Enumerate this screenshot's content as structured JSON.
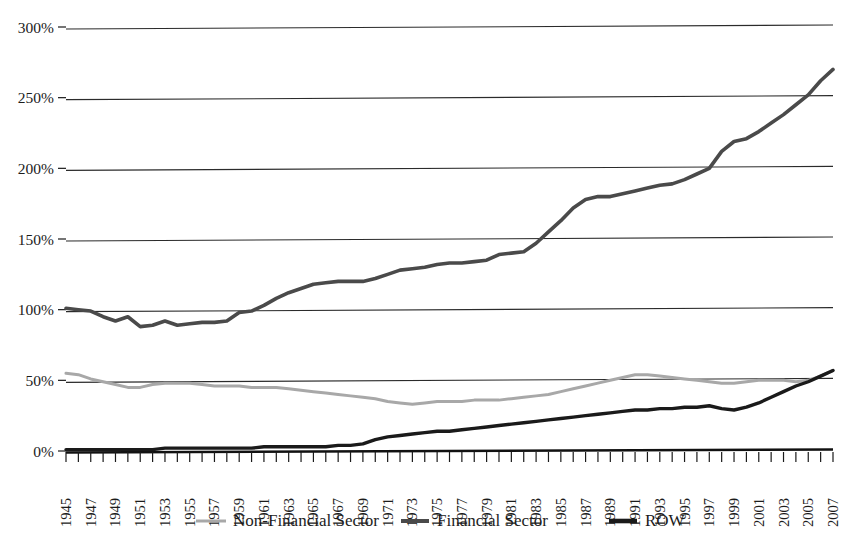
{
  "chart_data": {
    "type": "line",
    "title": "",
    "subtitle": "",
    "xlabel": "",
    "ylabel": "",
    "ylim": [
      0,
      300
    ],
    "xlim": [
      1945,
      2007
    ],
    "grid": true,
    "legend_position": "bottom",
    "ytick_labels": [
      "0%",
      "50%",
      "100%",
      "150%",
      "200%",
      "250%",
      "300%"
    ],
    "ytick_values": [
      0,
      50,
      100,
      150,
      200,
      250,
      300
    ],
    "xtick_labels": [
      "1945",
      "1947",
      "1949",
      "1951",
      "1953",
      "1955",
      "1957",
      "1959",
      "1961",
      "1963",
      "1965",
      "1967",
      "1969",
      "1971",
      "1973",
      "1975",
      "1977",
      "1979",
      "1981",
      "1983",
      "1985",
      "1987",
      "1989",
      "1991",
      "1993",
      "1995",
      "1997",
      "1999",
      "2001",
      "2003",
      "2005",
      "2007"
    ],
    "xtick_values": [
      1945,
      1947,
      1949,
      1951,
      1953,
      1955,
      1957,
      1959,
      1961,
      1963,
      1965,
      1967,
      1969,
      1971,
      1973,
      1975,
      1977,
      1979,
      1981,
      1983,
      1985,
      1987,
      1989,
      1991,
      1993,
      1995,
      1997,
      1999,
      2001,
      2003,
      2005,
      2007
    ],
    "x": [
      1945,
      1946,
      1947,
      1948,
      1949,
      1950,
      1951,
      1952,
      1953,
      1954,
      1955,
      1956,
      1957,
      1958,
      1959,
      1960,
      1961,
      1962,
      1963,
      1964,
      1965,
      1966,
      1967,
      1968,
      1969,
      1970,
      1971,
      1972,
      1973,
      1974,
      1975,
      1976,
      1977,
      1978,
      1979,
      1980,
      1981,
      1982,
      1983,
      1984,
      1985,
      1986,
      1987,
      1988,
      1989,
      1990,
      1991,
      1992,
      1993,
      1994,
      1995,
      1996,
      1997,
      1998,
      1999,
      2000,
      2001,
      2002,
      2003,
      2004,
      2005,
      2006,
      2007
    ],
    "series": [
      {
        "name": "Non-Financial Sector",
        "color": "#a8a8a8",
        "width": 3.0,
        "values": [
          55,
          54,
          51,
          49,
          47,
          45,
          45,
          47,
          48,
          48,
          48,
          47,
          46,
          46,
          46,
          45,
          45,
          45,
          44,
          43,
          42,
          41,
          40,
          39,
          38,
          37,
          35,
          34,
          33,
          34,
          35,
          35,
          35,
          36,
          36,
          36,
          37,
          38,
          39,
          40,
          42,
          44,
          46,
          48,
          50,
          52,
          54,
          54,
          53,
          52,
          51,
          50,
          49,
          48,
          48,
          49,
          50,
          50,
          50,
          49,
          50,
          53,
          57
        ]
      },
      {
        "name": "Financial Sector",
        "color": "#4a4a4a",
        "width": 3.6,
        "values": [
          101,
          100,
          99,
          95,
          92,
          95,
          88,
          89,
          92,
          89,
          90,
          91,
          91,
          92,
          98,
          99,
          103,
          108,
          112,
          115,
          118,
          119,
          120,
          120,
          120,
          122,
          125,
          128,
          129,
          130,
          132,
          133,
          133,
          134,
          135,
          139,
          140,
          141,
          147,
          155,
          163,
          172,
          178,
          180,
          180,
          182,
          184,
          186,
          188,
          189,
          192,
          196,
          200,
          212,
          219,
          221,
          226,
          232,
          238,
          245,
          252,
          262,
          270
        ]
      },
      {
        "name": "ROW",
        "color": "#1a1a1a",
        "width": 3.4,
        "values": [
          1,
          1,
          1,
          1,
          1,
          1,
          1,
          1,
          2,
          2,
          2,
          2,
          2,
          2,
          2,
          2,
          3,
          3,
          3,
          3,
          3,
          3,
          4,
          4,
          5,
          8,
          10,
          11,
          12,
          13,
          14,
          14,
          15,
          16,
          17,
          18,
          19,
          20,
          21,
          22,
          23,
          24,
          25,
          26,
          27,
          28,
          29,
          29,
          30,
          30,
          31,
          31,
          32,
          30,
          29,
          31,
          34,
          38,
          42,
          46,
          49,
          53,
          57
        ]
      }
    ]
  },
  "legend": {
    "items": [
      {
        "label": "Non-Financial Sector",
        "color": "#a8a8a8"
      },
      {
        "label": "Financial Sector",
        "color": "#4a4a4a"
      },
      {
        "label": "ROW",
        "color": "#1a1a1a"
      }
    ]
  }
}
